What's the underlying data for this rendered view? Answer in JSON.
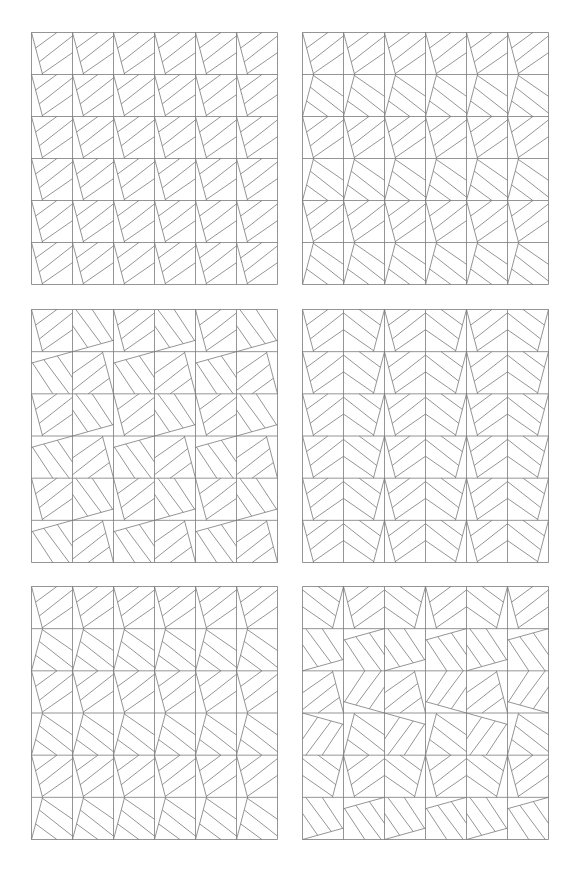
{
  "figure": {
    "stroke_color": "#7a7a7a",
    "background": "#ffffff",
    "grid": {
      "rows": 6,
      "cols": 6
    },
    "panels": [
      {
        "id": "panel-1",
        "x": 31,
        "y": 32,
        "w": 246,
        "h": 252,
        "orientations": [
          [
            0,
            0,
            0,
            0,
            0,
            0
          ],
          [
            0,
            0,
            0,
            0,
            0,
            0
          ],
          [
            0,
            0,
            0,
            0,
            0,
            0
          ],
          [
            0,
            0,
            0,
            0,
            0,
            0
          ],
          [
            0,
            0,
            0,
            0,
            0,
            0
          ],
          [
            0,
            0,
            0,
            0,
            0,
            0
          ]
        ]
      },
      {
        "id": "panel-2",
        "x": 302,
        "y": 32,
        "w": 246,
        "h": 252,
        "orientations": [
          [
            0,
            0,
            0,
            0,
            0,
            0
          ],
          [
            6,
            6,
            6,
            6,
            6,
            6
          ],
          [
            0,
            0,
            0,
            0,
            0,
            0
          ],
          [
            6,
            6,
            6,
            6,
            6,
            6
          ],
          [
            0,
            0,
            0,
            0,
            0,
            0
          ],
          [
            6,
            6,
            6,
            6,
            6,
            6
          ]
        ]
      },
      {
        "id": "panel-3",
        "x": 31,
        "y": 309,
        "w": 246,
        "h": 253,
        "orientations": [
          [
            0,
            3,
            0,
            3,
            0,
            3
          ],
          [
            1,
            2,
            1,
            2,
            1,
            2
          ],
          [
            0,
            3,
            0,
            3,
            0,
            3
          ],
          [
            1,
            2,
            1,
            2,
            1,
            2
          ],
          [
            0,
            3,
            0,
            3,
            0,
            3
          ],
          [
            1,
            2,
            1,
            2,
            1,
            2
          ]
        ]
      },
      {
        "id": "panel-4",
        "x": 302,
        "y": 309,
        "w": 246,
        "h": 253,
        "orientations": [
          [
            0,
            4,
            0,
            4,
            0,
            4
          ],
          [
            0,
            4,
            0,
            4,
            0,
            4
          ],
          [
            0,
            4,
            0,
            4,
            0,
            4
          ],
          [
            0,
            4,
            0,
            4,
            0,
            4
          ],
          [
            0,
            4,
            0,
            4,
            0,
            4
          ],
          [
            0,
            4,
            0,
            4,
            0,
            4
          ]
        ]
      },
      {
        "id": "panel-5",
        "x": 31,
        "y": 586,
        "w": 246,
        "h": 253,
        "orientations": [
          [
            0,
            0,
            0,
            0,
            0,
            0
          ],
          [
            6,
            6,
            6,
            6,
            6,
            6
          ],
          [
            0,
            0,
            0,
            0,
            0,
            0
          ],
          [
            6,
            6,
            6,
            6,
            6,
            6
          ],
          [
            0,
            0,
            0,
            0,
            0,
            0
          ],
          [
            6,
            6,
            6,
            6,
            6,
            6
          ]
        ]
      },
      {
        "id": "panel-6",
        "x": 302,
        "y": 586,
        "w": 246,
        "h": 253,
        "orientations": [
          [
            4,
            0,
            4,
            0,
            4,
            0
          ],
          [
            3,
            1,
            3,
            1,
            3,
            1
          ],
          [
            2,
            7,
            2,
            7,
            2,
            7
          ],
          [
            5,
            6,
            5,
            6,
            5,
            6
          ],
          [
            4,
            0,
            4,
            0,
            4,
            0
          ],
          [
            3,
            1,
            3,
            1,
            3,
            1
          ]
        ]
      }
    ]
  }
}
